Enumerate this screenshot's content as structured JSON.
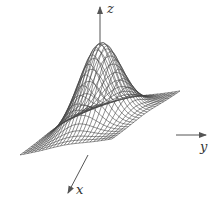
{
  "figure": {
    "type": "3d-wireframe-surface",
    "surface": "gaussian bump",
    "colors": {
      "mesh": "#444444",
      "axis": "#555555",
      "background": "#ffffff"
    }
  },
  "axes": {
    "z": {
      "label": "z"
    },
    "y": {
      "label": "y"
    },
    "x": {
      "label": "x"
    }
  },
  "chart_data": {
    "type": "surface",
    "title": "",
    "axis_labels": {
      "x": "x",
      "y": "y",
      "z": "z"
    },
    "grid": {
      "u_lines": 26,
      "v_lines": 26
    },
    "domain": {
      "x": [
        -2,
        2
      ],
      "y": [
        -2,
        2
      ]
    },
    "peak": {
      "x": 0,
      "y": 0,
      "z": 1
    },
    "ticks": "none"
  }
}
